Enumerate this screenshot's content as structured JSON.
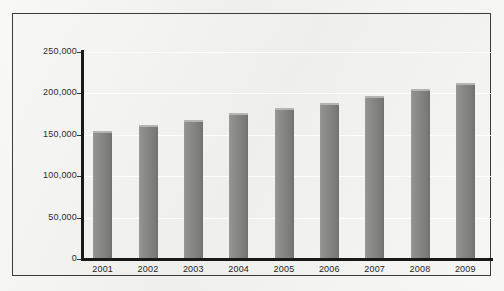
{
  "chart_data": {
    "type": "bar",
    "title": "",
    "subtitle": "",
    "xlabel": "",
    "ylabel": "",
    "categories": [
      "2001",
      "2002",
      "2003",
      "2004",
      "2005",
      "2006",
      "2007",
      "2008",
      "2009"
    ],
    "values": [
      155000,
      162000,
      168000,
      176000,
      182000,
      189000,
      197000,
      205000,
      213000
    ],
    "ylim": [
      0,
      250000
    ],
    "y_ticks": [
      0,
      50000,
      100000,
      150000,
      200000,
      250000
    ],
    "y_tick_labels": [
      "0",
      "50,000",
      "100,000",
      "150,000",
      "200,000",
      "250,000"
    ],
    "grid": true,
    "legend": null,
    "legend_position": "none",
    "series": [
      {
        "name": "",
        "values": [
          155000,
          162000,
          168000,
          176000,
          182000,
          189000,
          197000,
          205000,
          213000
        ]
      }
    ],
    "colors": {
      "bar_fill": "#848483",
      "bar_highlight": "#b4b4b3",
      "bar_shadow": "#6f6f6e",
      "axis": "#191919",
      "plot_background": "#eeeeec",
      "frame_border": "#3b3b3b",
      "gridline": "#ffffff",
      "label_text": "#2d2d2d"
    }
  }
}
